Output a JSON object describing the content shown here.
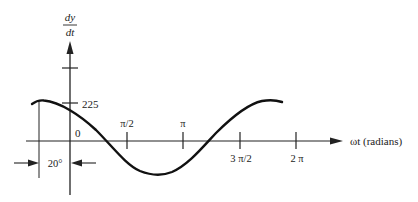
{
  "diagram": {
    "type": "cosine-waveform",
    "y_axis": {
      "label_numerator": "dy",
      "label_denominator": "dt",
      "tick_label": "225"
    },
    "x_axis": {
      "label": "ωt (radians)",
      "origin_label": "0",
      "ticks": [
        {
          "label": "π/2"
        },
        {
          "label": "π"
        },
        {
          "label": "3 π/2"
        },
        {
          "label": "2 π"
        }
      ]
    },
    "phase_annotation": {
      "label": "20°"
    },
    "colors": {
      "ink": "#222222",
      "background": "#ffffff"
    }
  }
}
